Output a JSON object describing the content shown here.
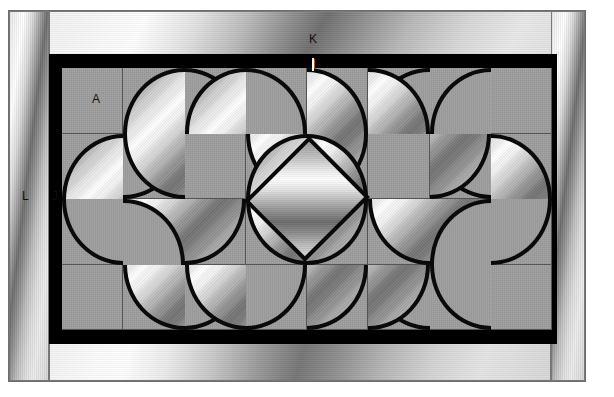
{
  "figure": {
    "background_color": "#ffffff",
    "tile_color": "#9e9e9e",
    "frame_color": "#000000",
    "outline_color": "#0a0a0a"
  },
  "labels": [
    {
      "id": "A",
      "text": "A",
      "x": 92,
      "y": 92,
      "color": "#111111",
      "refers_to": "tile"
    },
    {
      "id": "I",
      "text": "I",
      "x": 312,
      "y": 57,
      "color": "#ffffff",
      "refers_to": "inner black frame"
    },
    {
      "id": "J",
      "text": "J",
      "x": 52,
      "y": 189,
      "color": "#111111",
      "refers_to": "black border member"
    },
    {
      "id": "K",
      "text": "K",
      "x": 309,
      "y": 32,
      "color": "#111111",
      "refers_to": "top frame member"
    },
    {
      "id": "L",
      "text": "L",
      "x": 22,
      "y": 189,
      "color": "#111111",
      "refers_to": "outer frame member"
    }
  ],
  "grid": {
    "columns": 8,
    "rows": 4,
    "tile_width": 61.25,
    "tile_height": 65.5,
    "field_x": 62,
    "field_y": 68,
    "field_width": 490,
    "field_height": 262
  },
  "frames": {
    "outer": {
      "x": 8,
      "y": 10,
      "width": 578,
      "height": 372
    },
    "left": {
      "x": 9,
      "y": 11,
      "width": 40,
      "height": 370
    },
    "top": {
      "x": 49,
      "y": 11,
      "width": 536,
      "height": 44
    },
    "right": {
      "x": 551,
      "y": 11,
      "width": 34,
      "height": 370
    },
    "bottom": {
      "x": 49,
      "y": 343,
      "width": 502,
      "height": 38
    },
    "black": {
      "x": 49,
      "y": 54,
      "width": 508,
      "height": 290
    }
  },
  "motifs": {
    "diamond": {
      "center_x": 245,
      "center_y": 131,
      "size": 86
    },
    "petal_description": "quarter-circle metallic lobes",
    "notch_description": "quarter-circle gray recesses"
  }
}
